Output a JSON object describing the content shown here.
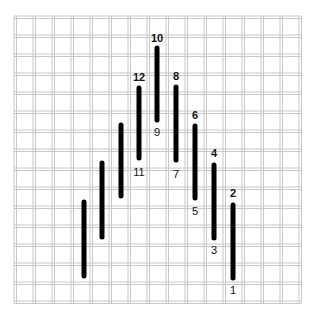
{
  "diagram": {
    "type": "needlepoint-stitch-chart",
    "grid": {
      "origin_x": 14,
      "origin_y": 16,
      "cell_size": 19,
      "columns": 15,
      "rows": 15,
      "line_color": "#c8c8c8"
    },
    "stitch_color": "#000000",
    "stitches": [
      {
        "x": 233,
        "y1": 205,
        "y2": 278,
        "top_label": "2",
        "bottom_label": "1"
      },
      {
        "x": 214,
        "y1": 165,
        "y2": 238,
        "top_label": "4",
        "bottom_label": "3"
      },
      {
        "x": 195,
        "y1": 126,
        "y2": 198,
        "top_label": "6",
        "bottom_label": "5"
      },
      {
        "x": 176,
        "y1": 87,
        "y2": 160,
        "top_label": "8",
        "bottom_label": "7"
      },
      {
        "x": 157,
        "y1": 48,
        "y2": 120,
        "top_label": "10",
        "bottom_label": "9"
      },
      {
        "x": 139,
        "y1": 88,
        "y2": 158,
        "top_label": "12",
        "bottom_label": "11"
      },
      {
        "x": 121,
        "y1": 125,
        "y2": 196,
        "top_label": "",
        "bottom_label": ""
      },
      {
        "x": 102,
        "y1": 163,
        "y2": 237,
        "top_label": "",
        "bottom_label": ""
      },
      {
        "x": 84,
        "y1": 202,
        "y2": 276,
        "top_label": "",
        "bottom_label": ""
      }
    ],
    "labels": {
      "l1": "1",
      "l2": "2",
      "l3": "3",
      "l4": "4",
      "l5": "5",
      "l6": "6",
      "l7": "7",
      "l8": "8",
      "l9": "9",
      "l10": "10",
      "l11": "11",
      "l12": "12"
    }
  }
}
